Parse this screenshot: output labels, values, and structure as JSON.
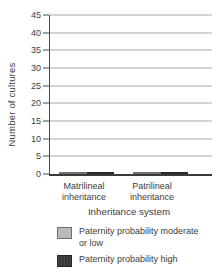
{
  "figure": {
    "background": "#ffffff",
    "text_color": "#3d3d3d"
  },
  "axes": {
    "y_title": "Number of cultures",
    "x_title": "Inheritance system"
  },
  "legend": {
    "items": [
      {
        "label": "Paternity probability moderate or low",
        "color": "#b9bab6"
      },
      {
        "label": "Paternity probability high",
        "color": "#3e3e3c"
      }
    ]
  },
  "chart_data": {
    "type": "bar",
    "title": "",
    "categories": [
      "Matrilineal inheritance",
      "Patrilineal inheritance"
    ],
    "series": [
      {
        "name": "Paternity probability moderate or low",
        "values": [
          16,
          4.5
        ],
        "color": "#b9bab6",
        "texture": "solid"
      },
      {
        "name": "Paternity probability high",
        "values": [
          2,
          44
        ],
        "color": "#3e3e3c",
        "texture": "vertical-hatch"
      }
    ],
    "xlabel": "Inheritance system",
    "ylabel": "Number of cultures",
    "ylim": [
      0,
      45
    ],
    "yticks": [
      0,
      5,
      10,
      15,
      20,
      25,
      30,
      35,
      40,
      45
    ],
    "grid": "horizontal",
    "gridline_color": "#a9a9a9",
    "axis_color": "#4a4a4a",
    "legend_position": "below"
  }
}
